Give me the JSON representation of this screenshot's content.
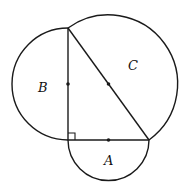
{
  "diagram": {
    "labels": {
      "A": "A",
      "B": "B",
      "C": "C"
    },
    "colors": {
      "stroke": "#1a1a1a",
      "background": "#ffffff"
    },
    "vertices": {
      "right_angle": [
        68,
        140
      ],
      "top": [
        68,
        28
      ],
      "right": [
        149,
        140
      ]
    }
  }
}
